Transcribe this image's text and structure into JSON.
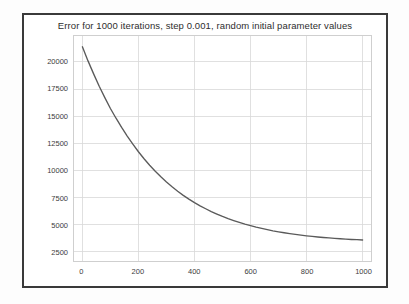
{
  "figure": {
    "title": "Error for 1000 iterations, step 0.001, random initial parameter values",
    "frame_color": "#3a3a3a",
    "background_color": "#ffffff",
    "page_background": "#fdfdfd"
  },
  "chart_data": {
    "type": "line",
    "title": "Error for 1000 iterations, step 0.001, random initial parameter values",
    "xlabel": "",
    "ylabel": "",
    "xlim": [
      -30,
      1030
    ],
    "ylim": [
      1600,
      22400
    ],
    "grid": true,
    "legend": null,
    "line_color": "#5a5a5a",
    "grid_color": "#d8d8d8",
    "xticks": [
      0,
      200,
      400,
      600,
      800,
      1000
    ],
    "xtick_labels": [
      "0",
      "200",
      "400",
      "600",
      "800",
      "1000"
    ],
    "yticks": [
      2500,
      5000,
      7500,
      10000,
      12500,
      15000,
      17500,
      20000
    ],
    "ytick_labels": [
      "2500",
      "5000",
      "7500",
      "10000",
      "12500",
      "15000",
      "17500",
      "20000"
    ],
    "series": [
      {
        "name": "error",
        "x": [
          0,
          20,
          40,
          60,
          80,
          100,
          120,
          140,
          160,
          180,
          200,
          220,
          240,
          260,
          280,
          300,
          320,
          340,
          360,
          380,
          400,
          420,
          440,
          460,
          480,
          500,
          520,
          540,
          560,
          580,
          600,
          620,
          640,
          660,
          680,
          700,
          720,
          740,
          760,
          780,
          800,
          820,
          840,
          860,
          880,
          900,
          920,
          940,
          960,
          980,
          1000
        ],
        "values": [
          21400,
          20100,
          18900,
          17750,
          16700,
          15700,
          14800,
          13950,
          13150,
          12400,
          11700,
          11050,
          10450,
          9900,
          9380,
          8900,
          8460,
          8050,
          7670,
          7320,
          7000,
          6700,
          6430,
          6170,
          5940,
          5720,
          5520,
          5340,
          5170,
          5010,
          4870,
          4730,
          4610,
          4500,
          4390,
          4300,
          4210,
          4130,
          4060,
          3990,
          3930,
          3870,
          3820,
          3770,
          3730,
          3690,
          3660,
          3620,
          3590,
          3570,
          3540
        ]
      }
    ],
    "annotations": []
  }
}
